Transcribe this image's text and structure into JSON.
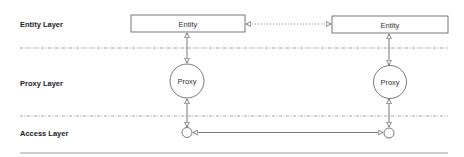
{
  "diagram": {
    "layers": [
      {
        "label": "Entity Layer"
      },
      {
        "label": "Proxy Layer"
      },
      {
        "label": "Access Layer"
      }
    ],
    "entities": [
      {
        "label": "Entity"
      },
      {
        "label": "Entity"
      }
    ],
    "proxies": [
      {
        "label": "Proxy"
      },
      {
        "label": "Proxy"
      }
    ],
    "access_points": [
      {
        "label": ""
      },
      {
        "label": ""
      }
    ],
    "connections": [
      {
        "from": "entity-left",
        "to": "entity-right",
        "style": "dotted",
        "arrows": "both-hollow"
      },
      {
        "from": "entity-left",
        "to": "proxy-left",
        "style": "solid",
        "arrows": "both-hollow"
      },
      {
        "from": "entity-right",
        "to": "proxy-right",
        "style": "solid",
        "arrows": "both-hollow"
      },
      {
        "from": "proxy-left",
        "to": "access-left",
        "style": "solid",
        "arrows": "both-hollow"
      },
      {
        "from": "proxy-right",
        "to": "access-right",
        "style": "solid",
        "arrows": "both-hollow"
      },
      {
        "from": "access-left",
        "to": "access-right",
        "style": "solid",
        "arrows": "both-hollow"
      }
    ],
    "colors": {
      "stroke": "#555555",
      "separator": "#888888",
      "bottom_rule": "#999999"
    }
  }
}
